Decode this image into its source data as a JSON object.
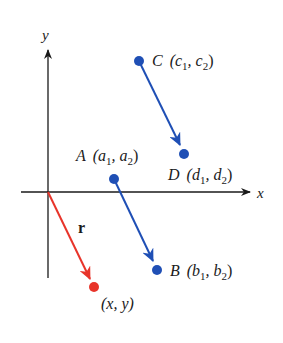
{
  "colors": {
    "axis": "#1a1a1a",
    "blue": "#1f4fb5",
    "red": "#e8342a",
    "text": "#1a1a1a"
  },
  "axes": {
    "x_label": "x",
    "y_label": "y"
  },
  "points": {
    "C": {
      "name": "C",
      "coords": "(c",
      "sub1": "1",
      "mid": ", c",
      "sub2": "2",
      "end": ")"
    },
    "D": {
      "name": "D",
      "coords": "(d",
      "sub1": "1",
      "mid": ", d",
      "sub2": "2",
      "end": ")"
    },
    "A": {
      "name": "A",
      "coords": "(a",
      "sub1": "1",
      "mid": ", a",
      "sub2": "2",
      "end": ")"
    },
    "B": {
      "name": "B",
      "coords": "(b",
      "sub1": "1",
      "mid": ", b",
      "sub2": "2",
      "end": ")"
    },
    "P": {
      "label": "(x, y)"
    }
  },
  "vectors": {
    "r_label": "r"
  }
}
